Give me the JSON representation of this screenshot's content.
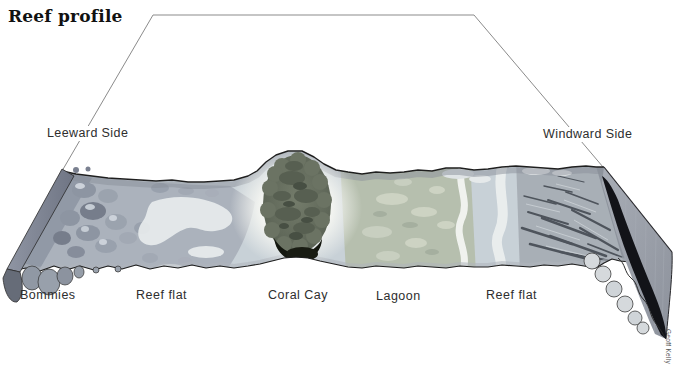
{
  "title": "Reef profile",
  "credit": "Geoff Kelly",
  "sides": {
    "leeward": {
      "label": "Leeward Side"
    },
    "windward": {
      "label": "Windward Side"
    }
  },
  "zones": [
    {
      "id": "bommies",
      "label": "Bommies"
    },
    {
      "id": "reef-flat-leeward",
      "label": "Reef flat"
    },
    {
      "id": "coral-cay",
      "label": "Coral Cay"
    },
    {
      "id": "lagoon",
      "label": "Lagoon"
    },
    {
      "id": "reef-flat-windward",
      "label": "Reef flat"
    }
  ],
  "colors": {
    "reef_flat": "#c8d1d7",
    "lagoon": "#b6bfae",
    "bommies_zone": "#aab0ba",
    "spur_zone": "#a7adb4",
    "cay_green": "#666e5e",
    "cay_shadow": "#14170f",
    "wall": "#121318",
    "sand": "#f4f5f1",
    "outline": "#8b8b8b",
    "edge": "#1f1f1f"
  }
}
